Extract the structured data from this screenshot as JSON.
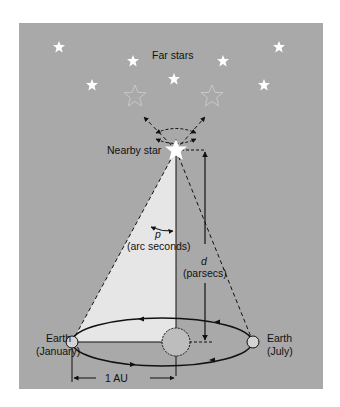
{
  "colors": {
    "page_background": "#ffffff",
    "panel_background": "#a9a9a9",
    "parallax_triangle_fill": "#e6e6e6",
    "star_fill": "#ffffff",
    "apparent_star_stroke": "#c4c4c4",
    "line_color": "#111111",
    "earth_fill": "#d3d3d3",
    "sun_fill": "#bdbdbd"
  },
  "labels": {
    "far_stars": "Far stars",
    "nearby_star": "Nearby star",
    "parallax_symbol": "p",
    "parallax_unit": "(arc seconds)",
    "distance_symbol": "d",
    "distance_unit": "(parsecs)",
    "earth_january_line1": "Earth",
    "earth_january_line2": "(January)",
    "earth_july_line1": "Earth",
    "earth_july_line2": "(July)",
    "au_label": "1 AU"
  },
  "far_stars": [
    {
      "x": 59,
      "y": 47
    },
    {
      "x": 133,
      "y": 61
    },
    {
      "x": 92,
      "y": 85
    },
    {
      "x": 174,
      "y": 79
    },
    {
      "x": 223,
      "y": 61
    },
    {
      "x": 279,
      "y": 47
    },
    {
      "x": 264,
      "y": 85
    }
  ],
  "apparent_positions": [
    {
      "x": 135,
      "y": 96
    },
    {
      "x": 212,
      "y": 96
    }
  ]
}
